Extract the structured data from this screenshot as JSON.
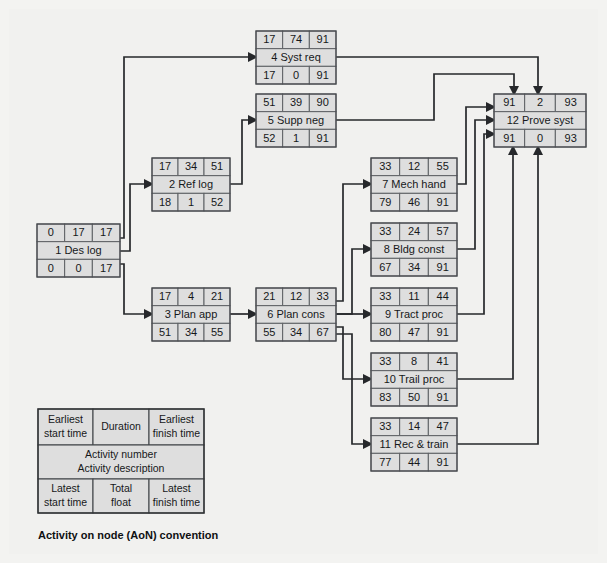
{
  "title": "Activity on node (AoN) convention",
  "diagram": {
    "type": "activity-on-node-network",
    "caption": "Activity on node (AoN) convention",
    "colors": {
      "background": "#f3f3f1",
      "node_fill": "#dedede",
      "node_border": "#5d6064",
      "connector": "#26282b",
      "text": "#16181a"
    },
    "cell_layout": {
      "top_row": [
        "Earliest start time",
        "Duration",
        "Earliest finish time"
      ],
      "middle_row": [
        "Activity number",
        "Activity description"
      ],
      "bottom_row": [
        "Latest start time",
        "Total float",
        "Latest finish time"
      ]
    },
    "nodes": [
      {
        "id": "1",
        "number": "1",
        "description": "Des log",
        "title": "1 Des log",
        "earliest_start": "0",
        "duration": "17",
        "earliest_finish": "17",
        "latest_start": "0",
        "total_float": "0",
        "latest_finish": "17",
        "x": 37,
        "y": 224,
        "w": 83,
        "h": 53
      },
      {
        "id": "2",
        "number": "2",
        "description": "Ref log",
        "title": "2 Ref log",
        "earliest_start": "17",
        "duration": "34",
        "earliest_finish": "51",
        "latest_start": "18",
        "total_float": "1",
        "latest_finish": "52",
        "x": 152,
        "y": 158,
        "w": 78,
        "h": 53
      },
      {
        "id": "3",
        "number": "3",
        "description": "Plan app",
        "title": "3 Plan app",
        "earliest_start": "17",
        "duration": "4",
        "earliest_finish": "21",
        "latest_start": "51",
        "total_float": "34",
        "latest_finish": "55",
        "x": 152,
        "y": 288,
        "w": 78,
        "h": 53
      },
      {
        "id": "4",
        "number": "4",
        "description": "Syst req",
        "title": "4 Syst req",
        "earliest_start": "17",
        "duration": "74",
        "earliest_finish": "91",
        "latest_start": "17",
        "total_float": "0",
        "latest_finish": "91",
        "x": 256,
        "y": 31,
        "w": 80,
        "h": 53
      },
      {
        "id": "5",
        "number": "5",
        "description": "Supp neg",
        "title": "5 Supp neg",
        "earliest_start": "51",
        "duration": "39",
        "earliest_finish": "90",
        "latest_start": "52",
        "total_float": "1",
        "latest_finish": "91",
        "x": 256,
        "y": 94,
        "w": 80,
        "h": 53
      },
      {
        "id": "6",
        "number": "6",
        "description": "Plan cons",
        "title": "6 Plan cons",
        "earliest_start": "21",
        "duration": "12",
        "earliest_finish": "33",
        "latest_start": "55",
        "total_float": "34",
        "latest_finish": "67",
        "x": 256,
        "y": 288,
        "w": 80,
        "h": 53
      },
      {
        "id": "7",
        "number": "7",
        "description": "Mech hand",
        "title": "7 Mech hand",
        "earliest_start": "33",
        "duration": "12",
        "earliest_finish": "55",
        "latest_start": "79",
        "total_float": "46",
        "latest_finish": "91",
        "x": 371,
        "y": 158,
        "w": 86,
        "h": 53
      },
      {
        "id": "8",
        "number": "8",
        "description": "Bldg const",
        "title": "8 Bldg const",
        "earliest_start": "33",
        "duration": "24",
        "earliest_finish": "57",
        "latest_start": "67",
        "total_float": "34",
        "latest_finish": "91",
        "x": 371,
        "y": 223,
        "w": 86,
        "h": 53
      },
      {
        "id": "9",
        "number": "9",
        "description": "Tract proc",
        "title": "9 Tract proc",
        "earliest_start": "33",
        "duration": "11",
        "earliest_finish": "44",
        "latest_start": "80",
        "total_float": "47",
        "latest_finish": "91",
        "x": 371,
        "y": 288,
        "w": 86,
        "h": 53
      },
      {
        "id": "10",
        "number": "10",
        "description": "Trail proc",
        "title": "10 Trail proc",
        "earliest_start": "33",
        "duration": "8",
        "earliest_finish": "41",
        "latest_start": "83",
        "total_float": "50",
        "latest_finish": "91",
        "x": 371,
        "y": 353,
        "w": 86,
        "h": 53
      },
      {
        "id": "11",
        "number": "11",
        "description": "Rec & train",
        "title": "11 Rec & train",
        "earliest_start": "33",
        "duration": "14",
        "earliest_finish": "47",
        "latest_start": "77",
        "total_float": "44",
        "latest_finish": "91",
        "x": 371,
        "y": 418,
        "w": 86,
        "h": 53
      },
      {
        "id": "12",
        "number": "12",
        "description": "Prove syst",
        "title": "12 Prove syst",
        "earliest_start": "91",
        "duration": "2",
        "earliest_finish": "93",
        "latest_start": "91",
        "total_float": "0",
        "latest_finish": "93",
        "x": 494,
        "y": 94,
        "w": 92,
        "h": 53
      }
    ],
    "edges": [
      {
        "from": "1",
        "to": "4"
      },
      {
        "from": "1",
        "to": "2"
      },
      {
        "from": "1",
        "to": "3"
      },
      {
        "from": "2",
        "to": "5"
      },
      {
        "from": "3",
        "to": "6"
      },
      {
        "from": "4",
        "to": "12"
      },
      {
        "from": "5",
        "to": "12"
      },
      {
        "from": "6",
        "to": "7"
      },
      {
        "from": "6",
        "to": "8"
      },
      {
        "from": "6",
        "to": "9"
      },
      {
        "from": "6",
        "to": "10"
      },
      {
        "from": "6",
        "to": "11"
      },
      {
        "from": "7",
        "to": "12"
      },
      {
        "from": "8",
        "to": "12"
      },
      {
        "from": "9",
        "to": "12"
      },
      {
        "from": "10",
        "to": "12"
      },
      {
        "from": "11",
        "to": "12"
      }
    ]
  },
  "legend": {
    "x": 38,
    "y": 409,
    "w": 166,
    "h": 104,
    "row1": {
      "left": "Earliest\nstart time",
      "left_line1": "Earliest",
      "left_line2": "start time",
      "middle": "Duration",
      "right_line1": "Earliest",
      "right_line2": "finish time"
    },
    "row2": {
      "line1": "Activity number",
      "line2": "Activity description"
    },
    "row3": {
      "left_line1": "Latest",
      "left_line2": "start time",
      "middle_line1": "Total",
      "middle_line2": "float",
      "right_line1": "Latest",
      "right_line2": "finish time"
    },
    "caption": "Activity on node (AoN) convention",
    "caption_x": 38,
    "caption_y": 534
  }
}
